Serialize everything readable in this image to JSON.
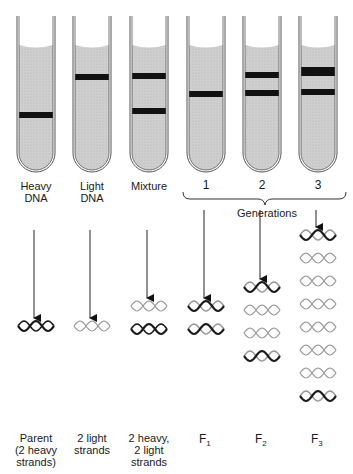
{
  "tubes": [
    {
      "id": "heavy",
      "label": "Heavy\nDNA",
      "bands": [
        {
          "y": 112,
          "h": 6
        }
      ]
    },
    {
      "id": "light",
      "label": "Light\nDNA",
      "bands": [
        {
          "y": 74,
          "h": 6
        }
      ]
    },
    {
      "id": "mixture",
      "label": "Mixture",
      "bands": [
        {
          "y": 73,
          "h": 6
        },
        {
          "y": 108,
          "h": 6
        }
      ]
    },
    {
      "id": "gen1",
      "label": "1",
      "bands": [
        {
          "y": 91,
          "h": 6
        }
      ]
    },
    {
      "id": "gen2",
      "label": "2",
      "bands": [
        {
          "y": 72,
          "h": 6
        },
        {
          "y": 90,
          "h": 6
        }
      ]
    },
    {
      "id": "gen3",
      "label": "3",
      "bands": [
        {
          "y": 67,
          "h": 9
        },
        {
          "y": 89,
          "h": 6
        }
      ]
    }
  ],
  "brace_label": "Generations",
  "bottom_labels": [
    {
      "text": "Parent\n(2 heavy\nstrands)"
    },
    {
      "text": "2 light\nstrands"
    },
    {
      "text": "2 heavy,\n2 light\nstrands"
    },
    {
      "text": "F",
      "sub": "1"
    },
    {
      "text": "F",
      "sub": "2"
    },
    {
      "text": "F",
      "sub": "3"
    }
  ],
  "molecules": {
    "heavy": [
      "heavy-heavy"
    ],
    "light": [
      "light-light"
    ],
    "mixture": [
      "light-light",
      "heavy-heavy"
    ],
    "gen1": [
      "hybrid",
      "hybrid"
    ],
    "gen2": [
      "hybrid",
      "light-light",
      "light-light",
      "hybrid"
    ],
    "gen3": [
      "hybrid",
      "light-light",
      "light-light",
      "light-light",
      "light-light",
      "light-light",
      "light-light",
      "hybrid"
    ]
  },
  "colors": {
    "liquid": "#c9c9c9",
    "band": "#111111",
    "glass": "#555555",
    "heavy_strand": "#1a1a1a",
    "light_strand": "#9a9a9a"
  }
}
